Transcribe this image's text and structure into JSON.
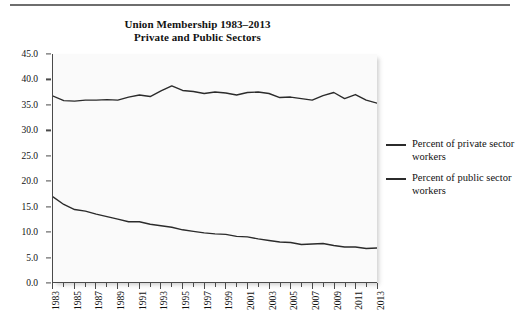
{
  "figure": {
    "title_line1": "Union Membership 1983–2013",
    "title_line2": "Private and Public Sectors"
  },
  "legend": {
    "entries": [
      {
        "label": "Percent of private sector workers",
        "color": "#2b2b2b"
      },
      {
        "label": "Percent of public sector workers",
        "color": "#2b2b2b"
      }
    ]
  },
  "chart_data": {
    "type": "line",
    "title": "Union Membership 1983–2013 Private and Public Sectors",
    "xlabel": "",
    "ylabel": "",
    "xlim": [
      1983,
      2013
    ],
    "ylim": [
      0.0,
      45.0
    ],
    "ytick_labels": [
      "0.0",
      "5.0",
      "10.0",
      "15.0",
      "20.0",
      "25.0",
      "30.0",
      "35.0",
      "40.0",
      "45.0"
    ],
    "ytick_values": [
      0.0,
      5.0,
      10.0,
      15.0,
      20.0,
      25.0,
      30.0,
      35.0,
      40.0,
      45.0
    ],
    "x": [
      1983,
      1984,
      1985,
      1986,
      1987,
      1988,
      1989,
      1990,
      1991,
      1992,
      1993,
      1994,
      1995,
      1996,
      1997,
      1998,
      1999,
      2000,
      2001,
      2002,
      2003,
      2004,
      2005,
      2006,
      2007,
      2008,
      2009,
      2010,
      2011,
      2012,
      2013
    ],
    "xtick_labels": [
      "1983",
      "1985",
      "1987",
      "1989",
      "1991",
      "1993",
      "1995",
      "1997",
      "1999",
      "2001",
      "2003",
      "2005",
      "2007",
      "2009",
      "2011",
      "2013"
    ],
    "xtick_label_rotation": -90,
    "grid": false,
    "legend_position": "right",
    "series": [
      {
        "name": "Percent of public sector workers",
        "color": "#2b2b2b",
        "values": [
          36.7,
          35.8,
          35.7,
          35.9,
          35.9,
          36.0,
          35.9,
          36.5,
          36.9,
          36.6,
          37.7,
          38.7,
          37.8,
          37.6,
          37.2,
          37.5,
          37.3,
          36.9,
          37.4,
          37.5,
          37.2,
          36.4,
          36.5,
          36.2,
          35.9,
          36.8,
          37.4,
          36.2,
          37.0,
          35.9,
          35.3
        ]
      },
      {
        "name": "Percent of private sector workers",
        "color": "#2b2b2b",
        "values": [
          16.8,
          15.3,
          14.3,
          14.0,
          13.4,
          12.9,
          12.4,
          11.9,
          11.9,
          11.4,
          11.1,
          10.8,
          10.3,
          10.0,
          9.7,
          9.5,
          9.4,
          9.0,
          8.9,
          8.5,
          8.2,
          7.9,
          7.8,
          7.4,
          7.5,
          7.6,
          7.2,
          6.9,
          6.9,
          6.6,
          6.7
        ]
      }
    ]
  }
}
